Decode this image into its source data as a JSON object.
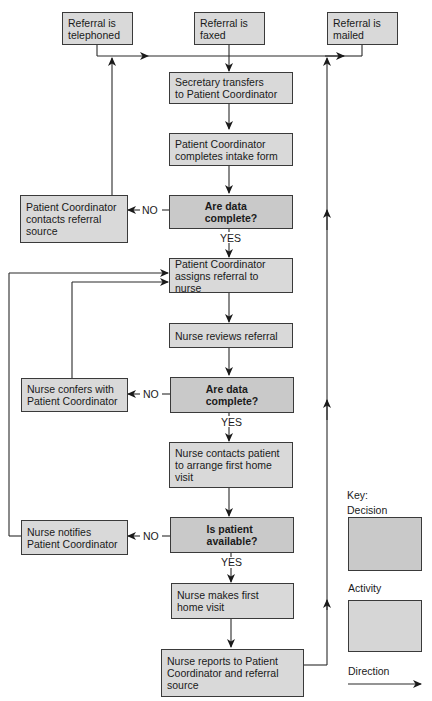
{
  "diagram": {
    "type": "flowchart",
    "sources": [
      {
        "id": "telephoned",
        "label": "Referral is\ntelephoned"
      },
      {
        "id": "faxed",
        "label": "Referral is\nfaxed"
      },
      {
        "id": "mailed",
        "label": "Referral is\nmailed"
      }
    ],
    "main_flow": [
      {
        "id": "secretary",
        "kind": "activity",
        "label": "Secretary transfers\nto Patient Coordinator"
      },
      {
        "id": "intake",
        "kind": "activity",
        "label": "Patient Coordinator\ncompletes intake form"
      },
      {
        "id": "decision1",
        "kind": "decision",
        "label": "Are data\ncomplete?"
      },
      {
        "id": "assign",
        "kind": "activity",
        "label": "Patient Coordinator\nassigns referral to nurse"
      },
      {
        "id": "review",
        "kind": "activity",
        "label": "Nurse reviews referral"
      },
      {
        "id": "decision2",
        "kind": "decision",
        "label": "Are data\ncomplete?"
      },
      {
        "id": "contact",
        "kind": "activity",
        "label": "Nurse contacts patient\nto arrange first home\nvisit"
      },
      {
        "id": "decision3",
        "kind": "decision",
        "label": "Is patient\navailable?"
      },
      {
        "id": "visit",
        "kind": "activity",
        "label": "Nurse makes first\nhome visit"
      },
      {
        "id": "report",
        "kind": "activity",
        "label": "Nurse reports to Patient\nCoordinator and referral\nsource"
      }
    ],
    "side_branches": [
      {
        "id": "pc_contacts",
        "label": "Patient Coordinator\ncontacts referral\nsource"
      },
      {
        "id": "nurse_confers",
        "label": "Nurse confers with\nPatient Coordinator"
      },
      {
        "id": "nurse_notifies",
        "label": "Nurse notifies\nPatient Coordinator"
      }
    ],
    "edge_labels": {
      "no": "NO",
      "yes": "YES"
    },
    "key": {
      "title": "Key:",
      "decision": "Decision",
      "activity": "Activity",
      "direction": "Direction"
    },
    "colors": {
      "activity_fill": "#d9d9d9",
      "decision_fill": "#c9c9c9",
      "stroke": "#3a3a3a"
    }
  }
}
